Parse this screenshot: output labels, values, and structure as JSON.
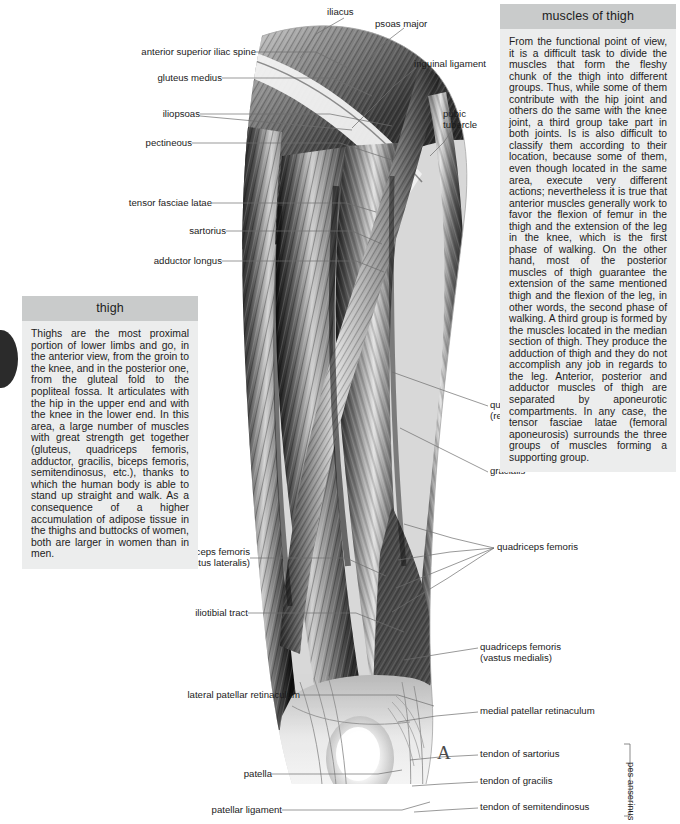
{
  "page": {
    "width": 680,
    "height": 824,
    "background": "#ffffff",
    "panel_header_bg": "#c9cbcb",
    "panel_body_bg": "#eceded",
    "text_color": "#1b1b1b"
  },
  "panels": {
    "right": {
      "title": "muscles of thigh",
      "body": "From the functional point of view, it is a difficult task to divide the muscles that form the fleshy chunk of the thigh into different groups. Thus, while some of them contribute with the hip joint and others do the same with the knee joint, a third group take part in both joints. Is is also difficult to classify them according to their location, because some of them, even though located in the same area, execute very different actions; nevertheless it is true that anterior muscles generally work to favor the flexion of femur in the thigh and the extension of the leg in the knee, which is the first phase of walking. On the other hand, most of the posterior muscles of thigh guarantee the extension of the same mentioned thigh and the flexion of the leg, in other words, the second phase of walking. A third group is formed by the muscles located in the median section of thigh. They produce the adduction of thigh and they do not accomplish any job in regards to the leg. Anterior, posterior and adductor muscles of thigh are separated by aponeurotic compartments. In any case, the tensor fasciae latae (femoral aponeurosis) surrounds the three groups of muscles forming a supporting group."
    },
    "left": {
      "title": "thigh",
      "body": "Thighs are the most proximal portion of lower limbs and go, in the anterior view, from the groin to the knee, and in the posterior one, from the gluteal fold to the popliteal fossa. It articulates with the hip in the upper end and with the knee in the lower end. In this area, a large number of muscles with great strength get together (gluteus, quadriceps femoris, adductor, gracilis, biceps femoris, semitendinosus, etc.), thanks to which the human body is able to stand up straight and walk. As a consequence of a higher accumulation of adipose tissue in the thighs and buttocks of women, both are larger in women than in men."
    }
  },
  "figure": {
    "name": "anterior-thigh-muscles-illustration",
    "marker": "A",
    "bracket_caption": "pes anserinus"
  },
  "labels_left": [
    {
      "id": "anterior-superior-iliac-spine",
      "text": "anterior superior iliac spine",
      "sub": ""
    },
    {
      "id": "gluteus-medius",
      "text": "gluteus medius",
      "sub": ""
    },
    {
      "id": "iliopsoas",
      "text": "iliopsoas",
      "sub": ""
    },
    {
      "id": "pectineous",
      "text": "pectineous",
      "sub": ""
    },
    {
      "id": "tensor-fasciae-latae",
      "text": "tensor fasciae latae",
      "sub": ""
    },
    {
      "id": "sartorius",
      "text": "sartorius",
      "sub": ""
    },
    {
      "id": "adductor-longus",
      "text": "adductor longus",
      "sub": ""
    },
    {
      "id": "quadriceps-femoris-vastus-lateralis",
      "text": "quadriceps femoris",
      "sub": "(vastus lateralis)"
    },
    {
      "id": "iliotibial-tract",
      "text": "iliotibial tract",
      "sub": ""
    },
    {
      "id": "lateral-patellar-retinaculum",
      "text": "lateral patellar retinaculum",
      "sub": ""
    },
    {
      "id": "patella",
      "text": "patella",
      "sub": ""
    },
    {
      "id": "patellar-ligament",
      "text": "patellar ligament",
      "sub": ""
    }
  ],
  "labels_right": [
    {
      "id": "iliacus",
      "text": "iliacus",
      "sub": ""
    },
    {
      "id": "psoas-major",
      "text": "psoas major",
      "sub": ""
    },
    {
      "id": "inguinal-ligament",
      "text": "inguinal ligament",
      "sub": ""
    },
    {
      "id": "pubic-tubercle",
      "text": "pubic",
      "sub": "tubercle"
    },
    {
      "id": "quadriceps-femoris-rectus-femoris",
      "text": "quadriceps femoris",
      "sub": "(rectus femoris)"
    },
    {
      "id": "gracialis",
      "text": "gracialis",
      "sub": ""
    },
    {
      "id": "quadriceps-femoris",
      "text": "quadriceps femoris",
      "sub": ""
    },
    {
      "id": "quadriceps-femoris-vastus-medialis",
      "text": "quadriceps femoris",
      "sub": "(vastus medialis)"
    },
    {
      "id": "medial-patellar-retinaculum",
      "text": "medial patellar retinaculum",
      "sub": ""
    },
    {
      "id": "tendon-of-sartorius",
      "text": "tendon of sartorius",
      "sub": ""
    },
    {
      "id": "tendon-of-gracilis",
      "text": "tendon of gracilis",
      "sub": ""
    },
    {
      "id": "tendon-of-semitendinosus",
      "text": "tendon of semitendinosus",
      "sub": ""
    }
  ]
}
